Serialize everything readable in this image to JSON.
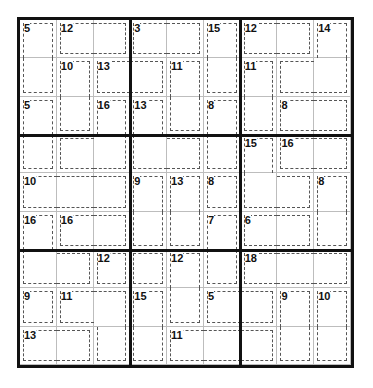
{
  "puzzle": {
    "type": "killer-sudoku",
    "size": 9,
    "cage_map": [
      [
        "A",
        "B",
        "B",
        "C",
        "C",
        "D",
        "E",
        "E",
        "F"
      ],
      [
        "A",
        "G",
        "H",
        "H",
        "I",
        "D",
        "J",
        "F",
        "F"
      ],
      [
        "K",
        "G",
        "L",
        "M",
        "I",
        "N",
        "J",
        "O",
        "O"
      ],
      [
        "K",
        "L",
        "L",
        "M",
        "M",
        "N",
        "P",
        "Q",
        "Q"
      ],
      [
        "R",
        "R",
        "R",
        "S",
        "T",
        "U",
        "P",
        "P",
        "V"
      ],
      [
        "W",
        "X",
        "X",
        "S",
        "T",
        "Y",
        "Z",
        "Z",
        "V"
      ],
      [
        "W",
        "W",
        "b",
        "c",
        "d",
        "Y",
        "e",
        "e",
        "e"
      ],
      [
        "f",
        "g",
        "g",
        "h",
        "d",
        "i",
        "i",
        "j",
        "k"
      ],
      [
        "l",
        "l",
        "g",
        "h",
        "m",
        "m",
        "m",
        "j",
        "k"
      ]
    ],
    "cage_sums": [
      {
        "row": 0,
        "col": 0,
        "sum": "5"
      },
      {
        "row": 0,
        "col": 1,
        "sum": "12"
      },
      {
        "row": 0,
        "col": 3,
        "sum": "3"
      },
      {
        "row": 0,
        "col": 5,
        "sum": "15"
      },
      {
        "row": 0,
        "col": 6,
        "sum": "12"
      },
      {
        "row": 0,
        "col": 8,
        "sum": "14"
      },
      {
        "row": 1,
        "col": 1,
        "sum": "10"
      },
      {
        "row": 1,
        "col": 2,
        "sum": "13"
      },
      {
        "row": 1,
        "col": 4,
        "sum": "11"
      },
      {
        "row": 1,
        "col": 6,
        "sum": "11"
      },
      {
        "row": 2,
        "col": 0,
        "sum": "5"
      },
      {
        "row": 2,
        "col": 2,
        "sum": "16"
      },
      {
        "row": 2,
        "col": 3,
        "sum": "13"
      },
      {
        "row": 2,
        "col": 5,
        "sum": "8"
      },
      {
        "row": 2,
        "col": 7,
        "sum": "8"
      },
      {
        "row": 3,
        "col": 6,
        "sum": "15"
      },
      {
        "row": 3,
        "col": 7,
        "sum": "16"
      },
      {
        "row": 4,
        "col": 0,
        "sum": "10"
      },
      {
        "row": 4,
        "col": 3,
        "sum": "9"
      },
      {
        "row": 4,
        "col": 4,
        "sum": "13"
      },
      {
        "row": 4,
        "col": 5,
        "sum": "8"
      },
      {
        "row": 4,
        "col": 8,
        "sum": "8"
      },
      {
        "row": 5,
        "col": 0,
        "sum": "16"
      },
      {
        "row": 5,
        "col": 1,
        "sum": "16"
      },
      {
        "row": 5,
        "col": 5,
        "sum": "7"
      },
      {
        "row": 5,
        "col": 6,
        "sum": "6"
      },
      {
        "row": 6,
        "col": 2,
        "sum": "12"
      },
      {
        "row": 6,
        "col": 4,
        "sum": "12"
      },
      {
        "row": 6,
        "col": 6,
        "sum": "18"
      },
      {
        "row": 7,
        "col": 0,
        "sum": "9"
      },
      {
        "row": 7,
        "col": 1,
        "sum": "11"
      },
      {
        "row": 7,
        "col": 3,
        "sum": "15"
      },
      {
        "row": 7,
        "col": 5,
        "sum": "5"
      },
      {
        "row": 7,
        "col": 7,
        "sum": "9"
      },
      {
        "row": 7,
        "col": 8,
        "sum": "10"
      },
      {
        "row": 8,
        "col": 0,
        "sum": "13"
      },
      {
        "row": 8,
        "col": 4,
        "sum": "11"
      }
    ],
    "colors": {
      "grid_border": "#111111",
      "cell_line": "#bdbdbd",
      "cage_line": "#555555",
      "background": "#ffffff"
    }
  }
}
